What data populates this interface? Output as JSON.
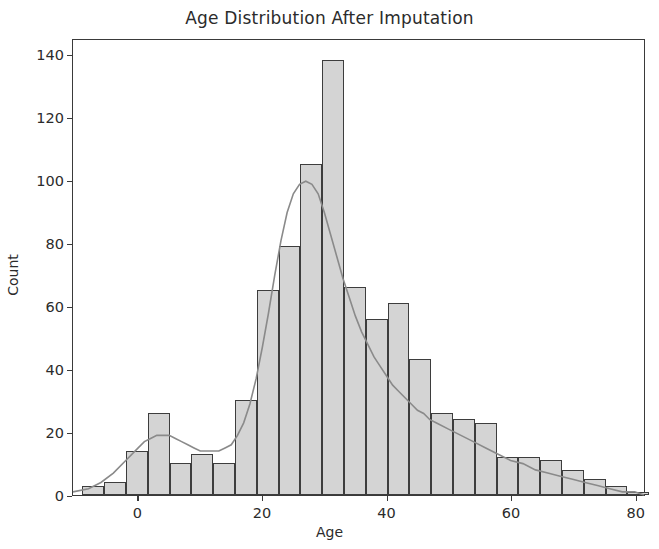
{
  "chart_data": {
    "type": "bar",
    "title": "Age Distribution After Imputation",
    "xlabel": "Age",
    "ylabel": "Count",
    "grid": false,
    "legend": null,
    "xlim": [
      -10.5,
      81.5
    ],
    "ylim": [
      0,
      145
    ],
    "xticks": [
      0,
      20,
      40,
      60,
      80
    ],
    "yticks": [
      0,
      20,
      40,
      60,
      80,
      100,
      120,
      140
    ],
    "bin_width": 3.5,
    "bin_starts": [
      -9.0,
      -5.5,
      -2.0,
      1.5,
      5.0,
      8.5,
      12.0,
      15.5,
      19.0,
      22.5,
      26.0,
      29.5,
      33.0,
      36.5,
      40.0,
      43.5,
      47.0,
      50.5,
      54.0,
      57.5,
      61.0,
      64.5,
      68.0,
      71.5,
      75.0,
      78.5
    ],
    "categories": [
      "-9.0",
      "-5.5",
      "-2.0",
      "1.5",
      "5.0",
      "8.5",
      "12.0",
      "15.5",
      "19.0",
      "22.5",
      "26.0",
      "29.5",
      "33.0",
      "36.5",
      "40.0",
      "43.5",
      "47.0",
      "50.5",
      "54.0",
      "57.5",
      "61.0",
      "64.5",
      "68.0",
      "71.5",
      "75.0",
      "78.5"
    ],
    "values": [
      3,
      4,
      14,
      26,
      10,
      13,
      10,
      30,
      65,
      79,
      105,
      138,
      66,
      56,
      61,
      43,
      26,
      24,
      23,
      12,
      12,
      11,
      8,
      5,
      3,
      1
    ],
    "bar_facecolor": "#d4d4d4",
    "bar_edgecolor": "#3d3d3d",
    "kde": {
      "label": "kde",
      "color": "#8a8a8a",
      "x": [
        -10.5,
        -8,
        -6,
        -4,
        -2,
        0,
        1,
        2,
        3,
        4,
        5,
        6,
        7,
        8,
        9,
        10,
        11,
        12,
        13,
        14,
        15,
        16,
        17,
        18,
        19,
        20,
        21,
        22,
        23,
        24,
        25,
        26,
        27,
        28,
        29,
        30,
        31,
        32,
        33,
        34,
        35,
        36,
        37,
        38,
        39,
        40,
        41,
        42,
        43,
        44,
        45,
        46,
        47,
        48,
        50,
        52,
        54,
        56,
        58,
        60,
        62,
        64,
        66,
        68,
        70,
        72,
        74,
        76,
        78,
        80,
        81.5
      ],
      "y": [
        1,
        2,
        4,
        7,
        11,
        15,
        17,
        18,
        19,
        19,
        19,
        18,
        17,
        16,
        15,
        14,
        14,
        14,
        14,
        15,
        16,
        19,
        23,
        29,
        37,
        47,
        58,
        70,
        81,
        90,
        96,
        99,
        100,
        99,
        96,
        90,
        83,
        76,
        69,
        63,
        57,
        52,
        48,
        44,
        41,
        38,
        35,
        33,
        31,
        29,
        27,
        26,
        24,
        23,
        21,
        19,
        17,
        15,
        13,
        11,
        10,
        8,
        7,
        6,
        5,
        4,
        3,
        2,
        1,
        1,
        0
      ]
    }
  }
}
